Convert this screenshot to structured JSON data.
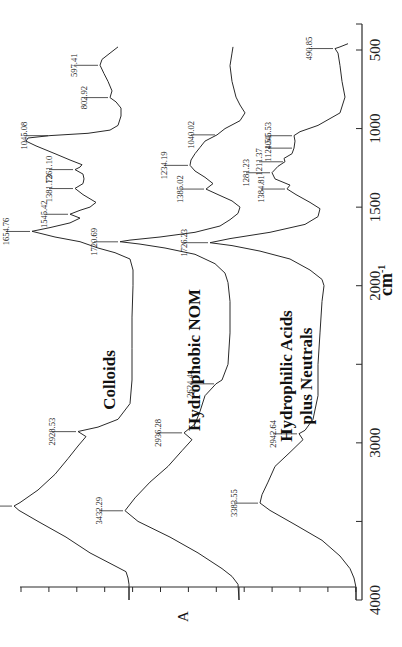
{
  "chart_data": {
    "type": "line",
    "title": "",
    "orientation": "rotated-90-clockwise",
    "xlabel": "cm-1",
    "xlabel_main": "cm",
    "xlabel_sup": "-1",
    "ylabel": "A",
    "xlim": [
      4000,
      500
    ],
    "xticks": [
      500,
      1000,
      1500,
      2000,
      2500,
      3000,
      3500,
      4000
    ],
    "xtick_labels": [
      "500",
      "1000",
      "1500",
      "2000",
      "",
      "3000",
      "",
      "4000"
    ],
    "grid": false,
    "legend": "none (inline series labels)",
    "series": [
      {
        "name": "Colloids",
        "label_lines": [
          "Colloids"
        ],
        "peaks": [
          "597.41",
          "802.92",
          "1045.08",
          "1261.10",
          "1381.73",
          "1545.42",
          "1654.76",
          "2928.53",
          "3402.35"
        ],
        "points": [
          [
            480,
            118
          ],
          [
            530,
            108
          ],
          [
            560,
            102
          ],
          [
            597,
            100
          ],
          [
            650,
            104
          ],
          [
            700,
            108
          ],
          [
            760,
            112
          ],
          [
            803,
            110
          ],
          [
            830,
            116
          ],
          [
            870,
            121
          ],
          [
            920,
            121
          ],
          [
            980,
            118
          ],
          [
            1010,
            110
          ],
          [
            1030,
            88
          ],
          [
            1045,
            50
          ],
          [
            1060,
            28
          ],
          [
            1080,
            26
          ],
          [
            1110,
            36
          ],
          [
            1160,
            55
          ],
          [
            1200,
            70
          ],
          [
            1230,
            82
          ],
          [
            1245,
            80
          ],
          [
            1261,
            75
          ],
          [
            1290,
            83
          ],
          [
            1320,
            84
          ],
          [
            1350,
            83
          ],
          [
            1381,
            75
          ],
          [
            1420,
            83
          ],
          [
            1470,
            96
          ],
          [
            1500,
            90
          ],
          [
            1520,
            80
          ],
          [
            1545,
            70
          ],
          [
            1570,
            80
          ],
          [
            1600,
            70
          ],
          [
            1630,
            50
          ],
          [
            1654,
            32
          ],
          [
            1690,
            55
          ],
          [
            1720,
            80
          ],
          [
            1760,
            98
          ],
          [
            1790,
            115
          ],
          [
            1830,
            130
          ],
          [
            1900,
            133
          ],
          [
            2000,
            133
          ],
          [
            2200,
            132
          ],
          [
            2400,
            132
          ],
          [
            2600,
            132
          ],
          [
            2750,
            130
          ],
          [
            2850,
            118
          ],
          [
            2900,
            98
          ],
          [
            2928,
            78
          ],
          [
            2960,
            86
          ],
          [
            3020,
            78
          ],
          [
            3100,
            68
          ],
          [
            3200,
            55
          ],
          [
            3300,
            38
          ],
          [
            3380,
            20
          ],
          [
            3402,
            14
          ],
          [
            3430,
            19
          ],
          [
            3500,
            38
          ],
          [
            3600,
            66
          ],
          [
            3700,
            90
          ],
          [
            3780,
            114
          ],
          [
            3820,
            126
          ],
          [
            3860,
            128
          ],
          [
            3900,
            129
          ],
          [
            4000,
            129
          ]
        ]
      },
      {
        "name": "Hydrophobic NOM",
        "label_lines": [
          "Hydrophobic NOM"
        ],
        "peaks": [
          "1040.02",
          "1234.19",
          "1385.02",
          "1720.69",
          "2624.44",
          "2936.28",
          "3432.29"
        ],
        "points": [
          [
            480,
            233
          ],
          [
            520,
            232
          ],
          [
            600,
            230
          ],
          [
            700,
            232
          ],
          [
            800,
            236
          ],
          [
            850,
            240
          ],
          [
            900,
            245
          ],
          [
            950,
            240
          ],
          [
            1000,
            225
          ],
          [
            1040,
            217
          ],
          [
            1080,
            205
          ],
          [
            1120,
            200
          ],
          [
            1160,
            195
          ],
          [
            1200,
            191
          ],
          [
            1234,
            190
          ],
          [
            1270,
            195
          ],
          [
            1310,
            205
          ],
          [
            1350,
            213
          ],
          [
            1385,
            206
          ],
          [
            1420,
            218
          ],
          [
            1460,
            232
          ],
          [
            1500,
            240
          ],
          [
            1540,
            238
          ],
          [
            1580,
            230
          ],
          [
            1620,
            220
          ],
          [
            1660,
            195
          ],
          [
            1690,
            160
          ],
          [
            1710,
            130
          ],
          [
            1720,
            120
          ],
          [
            1735,
            140
          ],
          [
            1760,
            165
          ],
          [
            1800,
            195
          ],
          [
            1860,
            215
          ],
          [
            1920,
            225
          ],
          [
            1980,
            228
          ],
          [
            2100,
            230
          ],
          [
            2300,
            230
          ],
          [
            2500,
            228
          ],
          [
            2600,
            222
          ],
          [
            2624,
            216
          ],
          [
            2700,
            205
          ],
          [
            2800,
            200
          ],
          [
            2880,
            195
          ],
          [
            2936,
            184
          ],
          [
            2980,
            192
          ],
          [
            3050,
            182
          ],
          [
            3150,
            168
          ],
          [
            3250,
            150
          ],
          [
            3350,
            135
          ],
          [
            3432,
            125
          ],
          [
            3500,
            138
          ],
          [
            3600,
            170
          ],
          [
            3700,
            198
          ],
          [
            3800,
            222
          ],
          [
            3850,
            232
          ],
          [
            3900,
            238
          ],
          [
            4000,
            239
          ]
        ]
      },
      {
        "name": "Hydrophilic Acids plus Neutrals",
        "label_lines": [
          "Hydrophilic Acids",
          "plus Neutrals"
        ],
        "peaks": [
          "490.85",
          "1045.53",
          "1124.51",
          "1211.37",
          "1281.23",
          "1384.81",
          "1726.23",
          "2942.64",
          "3383.55"
        ],
        "points": [
          [
            460,
            348
          ],
          [
            480,
            340
          ],
          [
            491,
            335
          ],
          [
            520,
            338
          ],
          [
            600,
            340
          ],
          [
            700,
            342
          ],
          [
            800,
            345
          ],
          [
            900,
            340
          ],
          [
            980,
            318
          ],
          [
            1020,
            300
          ],
          [
            1045,
            294
          ],
          [
            1080,
            295
          ],
          [
            1124,
            294
          ],
          [
            1160,
            292
          ],
          [
            1190,
            284
          ],
          [
            1211,
            285
          ],
          [
            1240,
            278
          ],
          [
            1281,
            272
          ],
          [
            1320,
            275
          ],
          [
            1360,
            290
          ],
          [
            1384,
            287
          ],
          [
            1420,
            296
          ],
          [
            1470,
            310
          ],
          [
            1510,
            320
          ],
          [
            1560,
            318
          ],
          [
            1610,
            305
          ],
          [
            1660,
            270
          ],
          [
            1700,
            230
          ],
          [
            1726,
            210
          ],
          [
            1745,
            232
          ],
          [
            1780,
            260
          ],
          [
            1830,
            290
          ],
          [
            1900,
            310
          ],
          [
            1960,
            322
          ],
          [
            2000,
            324
          ],
          [
            2100,
            322
          ],
          [
            2300,
            320
          ],
          [
            2500,
            318
          ],
          [
            2700,
            318
          ],
          [
            2850,
            313
          ],
          [
            2920,
            305
          ],
          [
            2942,
            299
          ],
          [
            2980,
            303
          ],
          [
            3060,
            290
          ],
          [
            3150,
            275
          ],
          [
            3250,
            268
          ],
          [
            3330,
            262
          ],
          [
            3383,
            260
          ],
          [
            3430,
            270
          ],
          [
            3520,
            295
          ],
          [
            3620,
            322
          ],
          [
            3720,
            340
          ],
          [
            3800,
            350
          ],
          [
            3860,
            354
          ],
          [
            3920,
            356
          ],
          [
            4000,
            356
          ]
        ]
      }
    ],
    "annotations": [
      {
        "series": "Colloids",
        "text": "597.41",
        "wn": 597.41,
        "x": 100
      },
      {
        "series": "Colloids",
        "text": "802.92",
        "wn": 802.92,
        "x": 110
      },
      {
        "series": "Colloids",
        "text": "1045.08",
        "wn": 1045.08,
        "x": 50
      },
      {
        "series": "Colloids",
        "text": "1261.10",
        "wn": 1261.1,
        "x": 75
      },
      {
        "series": "Colloids",
        "text": "1381.73",
        "wn": 1381.73,
        "x": 75
      },
      {
        "series": "Colloids",
        "text": "1545.42",
        "wn": 1545.42,
        "x": 70
      },
      {
        "series": "Colloids",
        "text": "1654.76",
        "wn": 1654.76,
        "x": 32
      },
      {
        "series": "Colloids",
        "text": "2928.53",
        "wn": 2928.53,
        "x": 78
      },
      {
        "series": "Colloids",
        "text": "3402.35",
        "wn": 3402.35,
        "x": 14
      },
      {
        "series": "Hydrophobic NOM",
        "text": "1040.02",
        "wn": 1040.02,
        "x": 217
      },
      {
        "series": "Hydrophobic NOM",
        "text": "1234.19",
        "wn": 1234.19,
        "x": 190
      },
      {
        "series": "Hydrophobic NOM",
        "text": "1385.02",
        "wn": 1385.02,
        "x": 206
      },
      {
        "series": "Hydrophobic NOM",
        "text": "1720.69",
        "wn": 1720.69,
        "x": 120
      },
      {
        "series": "Hydrophobic NOM",
        "text": "2624.44",
        "wn": 2624.44,
        "x": 216
      },
      {
        "series": "Hydrophobic NOM",
        "text": "2936.28",
        "wn": 2936.28,
        "x": 184
      },
      {
        "series": "Hydrophobic NOM",
        "text": "3432.29",
        "wn": 3432.29,
        "x": 125
      },
      {
        "series": "Hydrophilic Acids plus Neutrals",
        "text": "490.85",
        "wn": 490.85,
        "x": 335
      },
      {
        "series": "Hydrophilic Acids plus Neutrals",
        "text": "1045.53",
        "wn": 1045.53,
        "x": 294
      },
      {
        "series": "Hydrophilic Acids plus Neutrals",
        "text": "1124.51",
        "wn": 1124.51,
        "x": 294
      },
      {
        "series": "Hydrophilic Acids plus Neutrals",
        "text": "1211.37",
        "wn": 1211.37,
        "x": 285
      },
      {
        "series": "Hydrophilic Acids plus Neutrals",
        "text": "1281.23",
        "wn": 1281.23,
        "x": 272
      },
      {
        "series": "Hydrophilic Acids plus Neutrals",
        "text": "1384.81",
        "wn": 1384.81,
        "x": 287
      },
      {
        "series": "Hydrophilic Acids plus Neutrals",
        "text": "1726.23",
        "wn": 1726.23,
        "x": 210
      },
      {
        "series": "Hydrophilic Acids plus Neutrals",
        "text": "2942.64",
        "wn": 2942.64,
        "x": 299
      },
      {
        "series": "Hydrophilic Acids plus Neutrals",
        "text": "3383.55",
        "wn": 3383.55,
        "x": 260
      }
    ]
  }
}
